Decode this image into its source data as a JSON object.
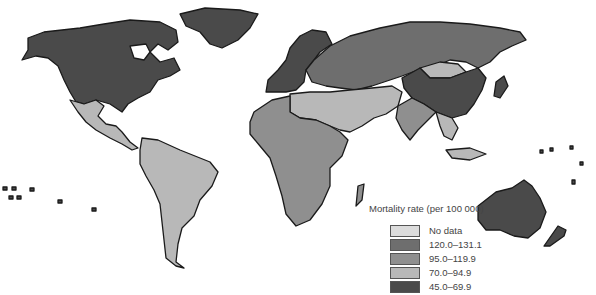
{
  "map": {
    "title": "Mortality rate (per 100 000)",
    "legend": [
      {
        "label": "No data",
        "color": "#dcdcdc"
      },
      {
        "label": "120.0–131.1",
        "color": "#6e6e6e"
      },
      {
        "label": "95.0–119.9",
        "color": "#8f8f8f"
      },
      {
        "label": "70.0–94.9",
        "color": "#b8b8b8"
      },
      {
        "label": "45.0–69.9",
        "color": "#4a4a4a"
      }
    ],
    "regions": [
      {
        "name": "North America",
        "class": "45.0–69.9"
      },
      {
        "name": "Mexico & Central America",
        "class": "70.0–94.9"
      },
      {
        "name": "South America",
        "class": "70.0–94.9"
      },
      {
        "name": "Western Europe",
        "class": "45.0–69.9"
      },
      {
        "name": "Russia & Eastern Europe",
        "class": "120.0–131.1"
      },
      {
        "name": "North Africa & Middle East",
        "class": "70.0–94.9"
      },
      {
        "name": "Sub-Saharan Africa",
        "class": "95.0–119.9"
      },
      {
        "name": "South Asia",
        "class": "95.0–119.9"
      },
      {
        "name": "China",
        "class": "45.0–69.9"
      },
      {
        "name": "Mongolia",
        "class": "70.0–94.9"
      },
      {
        "name": "Southeast Asia",
        "class": "70.0–94.9"
      },
      {
        "name": "Australia & New Zealand",
        "class": "45.0–69.9"
      }
    ]
  }
}
